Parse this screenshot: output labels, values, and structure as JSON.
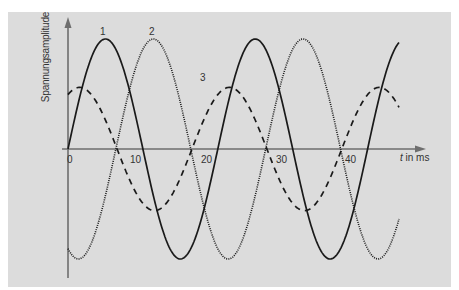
{
  "chart_data": {
    "type": "line",
    "title": "",
    "xlabel": "t in ms",
    "ylabel": "Spannungsamplitude",
    "x_ticks": [
      "0",
      "10",
      "20",
      "30",
      "40"
    ],
    "xlim": [
      0,
      47
    ],
    "grid": false,
    "legend": "inline curve numbers",
    "period_ms": 21.4,
    "series": [
      {
        "name": "1",
        "style": "solid",
        "relative_amplitude": 1.0,
        "phase_deg": 0,
        "description": "sine starting at 0, peak near t≈5 ms",
        "peaks_t_ms": [
          5.3,
          26.7
        ],
        "troughs_t_ms": [
          16.7,
          37.7
        ]
      },
      {
        "name": "2",
        "style": "dotted",
        "relative_amplitude": 1.0,
        "phase_deg": -115,
        "description": "lags curve 1, peak near t≈12 ms",
        "peaks_t_ms": [
          12.2,
          33.7
        ],
        "troughs_t_ms": [
          2.1,
          23.1,
          44.3
        ]
      },
      {
        "name": "3",
        "style": "dashed",
        "relative_amplitude": 0.56,
        "phase_deg": 62,
        "description": "smaller amplitude, peak near t≈19.7 ms",
        "peaks_t_ms": [
          19.7,
          41.0
        ],
        "troughs_t_ms": [
          9.3,
          30.7
        ]
      }
    ],
    "annotations": [
      {
        "text": "1",
        "near_t_ms": 5
      },
      {
        "text": "2",
        "near_t_ms": 12
      },
      {
        "text": "3",
        "near_t_ms": 19.5
      }
    ]
  },
  "labels": {
    "y_axis": "Spannungsamplitude",
    "x_axis_var": "t",
    "x_axis_unit": " in ms",
    "ticks": [
      "0",
      "10",
      "20",
      "30",
      "40"
    ],
    "curve1": "1",
    "curve2": "2",
    "curve3": "3"
  },
  "colors": {
    "panel": "#dcdcdc",
    "axis": "#6e6e6e",
    "curve": "#1a1a1a"
  }
}
